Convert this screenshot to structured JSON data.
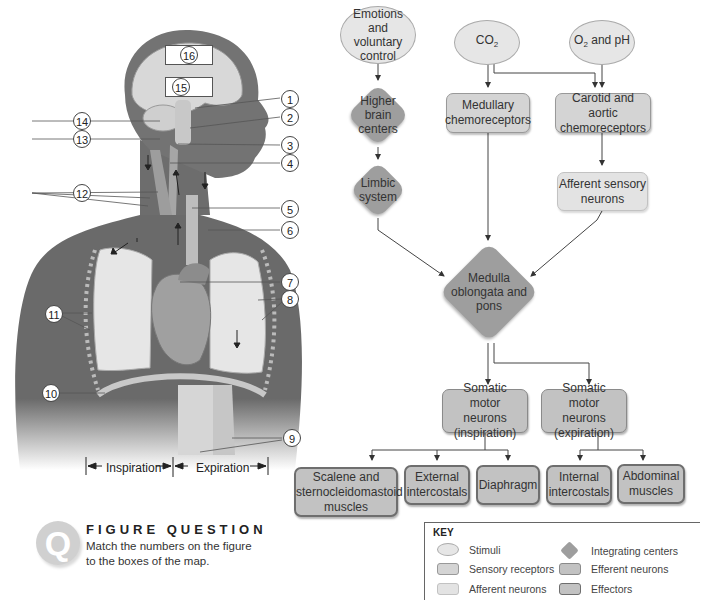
{
  "anatomy": {
    "brain_labels": [
      "16",
      "15"
    ],
    "right_labels": [
      "1",
      "2",
      "3",
      "4",
      "5",
      "6",
      "7",
      "8",
      "9"
    ],
    "left_labels": [
      "14",
      "13",
      "12",
      "11",
      "10"
    ],
    "phases": {
      "inspiration": "Inspiration",
      "expiration": "Expiration"
    }
  },
  "map": {
    "stimuli": {
      "emotions": "Emotions and voluntary control",
      "co2": {
        "base": "CO",
        "sub": "2"
      },
      "o2ph": {
        "base": "O",
        "sub": "2",
        "rest": " and pH"
      }
    },
    "integrating": {
      "higher": "Higher brain centers",
      "limbic": "Limbic system",
      "medulla": "Medulla oblongata and pons"
    },
    "sensory": {
      "medullary": "Medullary chemoreceptors",
      "carotid": "Carotid and aortic chemoreceptors"
    },
    "afferent": {
      "sensory_neurons": "Afferent sensory neurons"
    },
    "efferent": {
      "inspiration": "Somatic motor neurons (inspiration)",
      "expiration": "Somatic motor neurons (expiration)"
    },
    "effectors": {
      "scalene": "Scalene and sternocleidomastoid muscles",
      "ext_intercostals": "External intercostals",
      "diaphragm": "Diaphragm",
      "int_intercostals": "Internal intercostals",
      "abdominal": "Abdominal muscles"
    }
  },
  "figure_question": {
    "icon": "Q",
    "title": "FIGURE QUESTION",
    "text": "Match the numbers on the figure to the boxes of the map."
  },
  "key": {
    "title": "KEY",
    "items": [
      {
        "label": "Stimuli",
        "shape": "ellipse"
      },
      {
        "label": "Sensory receptors",
        "shape": "rect"
      },
      {
        "label": "Afferent neurons",
        "shape": "rect"
      },
      {
        "label": "Integrating centers",
        "shape": "diamond"
      },
      {
        "label": "Efferent neurons",
        "shape": "rect"
      },
      {
        "label": "Effectors",
        "shape": "rect"
      }
    ]
  },
  "colors": {
    "stimuli": "#e6e6e6",
    "sensory": "#d4d4d4",
    "afferent": "#e3e3e3",
    "integrating": "#9e9e9e",
    "efferent": "#c2c2c2",
    "effectors": "#c2c2c2"
  }
}
